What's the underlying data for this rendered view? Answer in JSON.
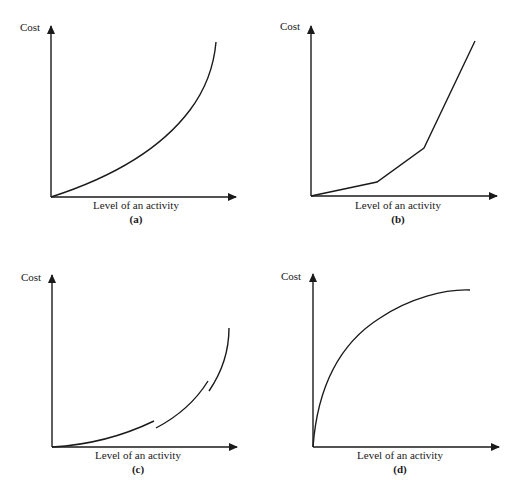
{
  "panels": [
    {
      "id": "a",
      "y_label": "Cost",
      "x_label": "Level of an activity",
      "caption": "(a)",
      "shape": "convex increasing curve"
    },
    {
      "id": "b",
      "y_label": "Cost",
      "x_label": "Level of an activity",
      "caption": "(b)",
      "shape": "piecewise linear increasing, steeper segments"
    },
    {
      "id": "c",
      "y_label": "Cost",
      "x_label": "Level of an activity",
      "caption": "(c)",
      "shape": "discontinuous convex increasing curve (3 segments)"
    },
    {
      "id": "d",
      "y_label": "Cost",
      "x_label": "Level of an activity",
      "caption": "(d)",
      "shape": "concave increasing curve levelling off"
    }
  ],
  "colors": {
    "line": "#1a1a1a",
    "background": "#ffffff"
  }
}
